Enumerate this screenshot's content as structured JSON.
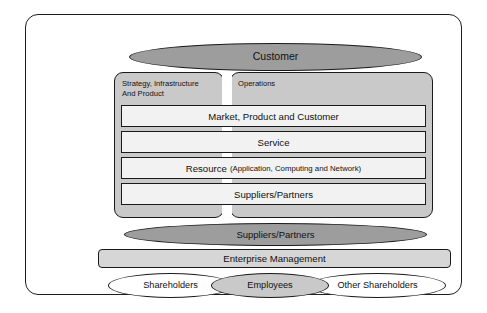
{
  "diagram": {
    "colors": {
      "frame_border": "#1d1d1d",
      "dark_ellipse": "#9d9d9d",
      "panel_gray": "#c9c9c9",
      "layer_fill": "#f2f2f2",
      "enterprise_bar": "#d6d6d6",
      "text": "#111111",
      "background": "#ffffff"
    },
    "top_ellipse": {
      "label": "Customer",
      "fill": "dark"
    },
    "panels": [
      {
        "id": "sip",
        "label": "Strategy, Infrastructure\nAnd Product",
        "fill": "panel_gray"
      },
      {
        "id": "operations",
        "label": "Operations",
        "fill": "panel_gray"
      }
    ],
    "layers": [
      {
        "id": "market",
        "label": "Market, Product and Customer",
        "sub": ""
      },
      {
        "id": "service",
        "label": "Service",
        "sub": ""
      },
      {
        "id": "resource",
        "label": "Resource",
        "sub": "(Application, Computing and Network)"
      },
      {
        "id": "suppliers",
        "label": "Suppliers/Partners",
        "sub": ""
      }
    ],
    "bottom_ellipse": {
      "label": "Suppliers/Partners",
      "fill": "dark"
    },
    "enterprise_bar": {
      "label": "Enterprise Management",
      "fill": "enterprise_bar"
    },
    "stakeholders": [
      {
        "id": "shareholders",
        "label": "Shareholders",
        "fill": "white"
      },
      {
        "id": "employees",
        "label": "Employees",
        "fill": "light"
      },
      {
        "id": "other-shareholders",
        "label": "Other Shareholders",
        "fill": "white"
      }
    ]
  }
}
